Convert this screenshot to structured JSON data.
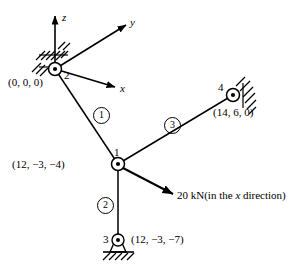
{
  "figure": {
    "type": "space-truss-diagram",
    "line_color": "#000000",
    "background": "#ffffff"
  },
  "axes": {
    "origin_node": "2",
    "labels": {
      "z": "z",
      "y": "y",
      "x": "x"
    }
  },
  "nodes": [
    {
      "id": "2",
      "number": "2",
      "coord_label": "(0, 0, 0)",
      "support": "wall-hatched",
      "cx": 55,
      "cy": 69
    },
    {
      "id": "1",
      "number": "1",
      "coord_label": "(12, −3, −4)",
      "support": "none",
      "cx": 118,
      "cy": 164
    },
    {
      "id": "4",
      "number": "4",
      "coord_label": "(14, 6, 0)",
      "support": "wall-hatched",
      "cx": 233,
      "cy": 95
    },
    {
      "id": "3",
      "number": "3",
      "coord_label": "(12, −3, −7)",
      "support": "ground-hatched",
      "cx": 118,
      "cy": 240
    }
  ],
  "elements": [
    {
      "id": "1",
      "label": "1",
      "from": "2",
      "to": "1",
      "badge_x": 93,
      "badge_y": 107
    },
    {
      "id": "2",
      "label": "2",
      "from": "1",
      "to": "3",
      "badge_x": 97,
      "badge_y": 197
    },
    {
      "id": "3",
      "label": "3",
      "from": "1",
      "to": "4",
      "badge_x": 164,
      "badge_y": 117
    }
  ],
  "load": {
    "magnitude": "20 kN",
    "direction_prefix": "(in the ",
    "direction_axis": "x",
    "direction_suffix": " direction)",
    "full_text": "20 kN (in the x direction)",
    "applied_at_node": "1"
  }
}
